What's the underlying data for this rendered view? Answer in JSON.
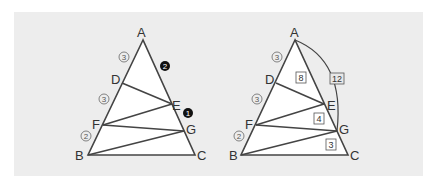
{
  "colors": {
    "background": "#ffffff",
    "panel": "#ededed",
    "triangle_fill": "#ffffff",
    "line": "#444444",
    "label": "#333333",
    "ratio_circle_outline": "#555555",
    "ratio_circle_filled": "#111111",
    "box_border": "#555555"
  },
  "left_figure": {
    "vertices": {
      "A": "A",
      "B": "B",
      "C": "C",
      "D": "D",
      "E": "E",
      "F": "F",
      "G": "G"
    },
    "ratios_AB": {
      "AD": "3",
      "DF": "3",
      "FB": "2"
    },
    "ratios_AC": {
      "AE": "2",
      "EG": "1"
    },
    "segments": [
      "DE",
      "EF",
      "FG",
      "GB"
    ]
  },
  "right_figure": {
    "vertices": {
      "A": "A",
      "B": "B",
      "C": "C",
      "D": "D",
      "E": "E",
      "F": "F",
      "G": "G"
    },
    "ratios_AB": {
      "AD": "3",
      "DF": "3",
      "FB": "2"
    },
    "boxed_lengths": {
      "AE": "8",
      "EG": "4",
      "GC": "3",
      "AG": "12"
    },
    "segments": [
      "DE",
      "EF",
      "FG",
      "GB"
    ],
    "arc": "A-G"
  }
}
